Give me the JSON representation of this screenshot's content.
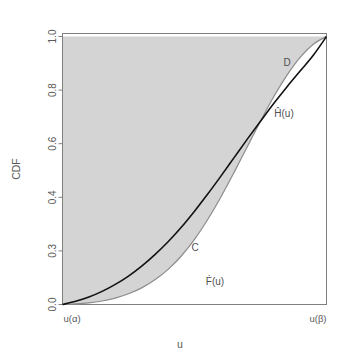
{
  "chart_data": {
    "type": "line",
    "title": "",
    "xlabel": "u",
    "ylabel": "CDF",
    "grid": false,
    "legend": "none",
    "xlim": [
      0,
      1
    ],
    "ylim": [
      0,
      1
    ],
    "x_tick_labels": [
      "u(α)",
      "u(β)"
    ],
    "x_tick_positions": [
      0,
      1
    ],
    "y_tick_labels": [
      "0.0",
      "0.3",
      "0.4",
      "0.6",
      "0.8",
      "1.0"
    ],
    "y_tick_values": [
      0.0,
      0.2,
      0.4,
      0.6,
      0.8,
      1.0
    ],
    "series": [
      {
        "name": "Ĥ(u)",
        "label": "Ĥ(u)",
        "color": "#111111",
        "x": [
          0.0,
          0.05,
          0.1,
          0.15,
          0.2,
          0.25,
          0.3,
          0.35,
          0.4,
          0.45,
          0.5,
          0.55,
          0.6,
          0.65,
          0.7,
          0.75,
          0.8,
          0.85,
          0.9,
          0.95,
          1.0
        ],
        "y": [
          0.0,
          0.012,
          0.028,
          0.049,
          0.075,
          0.106,
          0.143,
          0.186,
          0.234,
          0.288,
          0.348,
          0.412,
          0.479,
          0.548,
          0.617,
          0.684,
          0.75,
          0.812,
          0.871,
          0.93,
          1.0
        ]
      },
      {
        "name": "Ḟ(u)",
        "label": "Ḟ(u)",
        "color": "#8c8c8c",
        "x": [
          0.0,
          0.05,
          0.1,
          0.15,
          0.2,
          0.25,
          0.3,
          0.35,
          0.4,
          0.45,
          0.5,
          0.55,
          0.6,
          0.65,
          0.7,
          0.75,
          0.8,
          0.85,
          0.9,
          0.95,
          1.0
        ],
        "y": [
          0.0,
          0.002,
          0.006,
          0.013,
          0.024,
          0.04,
          0.062,
          0.092,
          0.131,
          0.181,
          0.243,
          0.317,
          0.401,
          0.493,
          0.589,
          0.684,
          0.775,
          0.855,
          0.922,
          0.971,
          1.0
        ]
      }
    ],
    "shaded_region": {
      "name": "area-under-one-above-F",
      "color": "#d4d4d4",
      "description": "region between Ḟ(u) and CDF = 1.0"
    },
    "annotations": [
      {
        "text": "D",
        "x": 0.855,
        "y": 0.885,
        "name": "region-label-d"
      },
      {
        "text": "Ĥ(u)",
        "x": 0.845,
        "y": 0.7,
        "name": "curve-label-h"
      },
      {
        "text": "C",
        "x": 0.5,
        "y": 0.26,
        "name": "region-label-c"
      },
      {
        "text": "Ḟ(u)",
        "x": 0.575,
        "y": 0.135,
        "name": "curve-label-f"
      }
    ]
  },
  "axes": {
    "x_title": "u",
    "y_title": "CDF",
    "x_left_label": "u(α)",
    "x_right_label": "u(β)",
    "y_ticks": [
      "1.0",
      "0.8",
      "0.6",
      "0.4",
      "0.3",
      "0.0"
    ]
  },
  "colors": {
    "background": "#ffffff",
    "shade": "#d4d4d4",
    "h_curve": "#111111",
    "f_curve": "#8c8c8c",
    "axis": "#737373",
    "text": "#595959"
  }
}
